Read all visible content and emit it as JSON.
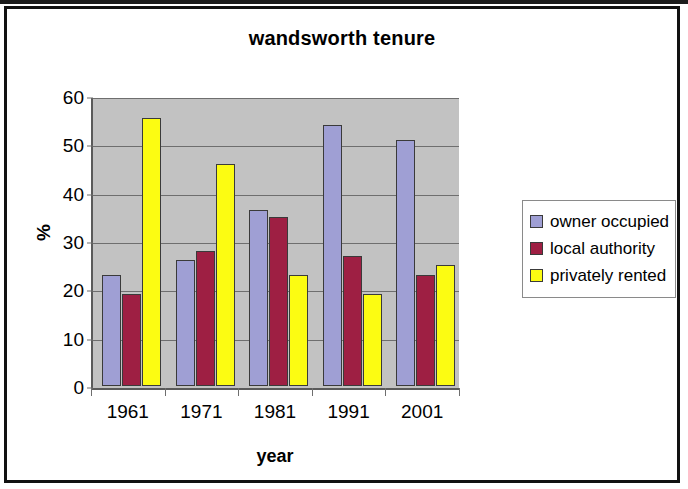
{
  "chart_data": {
    "type": "bar",
    "title": "wandsworth tenure",
    "xlabel": "year",
    "ylabel": "%",
    "categories": [
      "1961",
      "1971",
      "1981",
      "1991",
      "2001"
    ],
    "series": [
      {
        "name": "owner occupied",
        "color": "#9f9fd4",
        "values": [
          23,
          26,
          36.5,
          54,
          51
        ]
      },
      {
        "name": "local authority",
        "color": "#9e1f43",
        "values": [
          19,
          28,
          35,
          27,
          23
        ]
      },
      {
        "name": "privately rented",
        "color": "#fcfc12",
        "values": [
          55.5,
          46,
          23,
          19,
          25
        ]
      }
    ],
    "ylim": [
      0,
      60
    ],
    "yticks": [
      0,
      10,
      20,
      30,
      40,
      50,
      60
    ],
    "grid": true,
    "legend_position": "right",
    "plot_background": "#c2c2c2"
  },
  "legend": {
    "items": [
      {
        "label": "owner occupied"
      },
      {
        "label": "local authority"
      },
      {
        "label": "privately rented"
      }
    ]
  }
}
